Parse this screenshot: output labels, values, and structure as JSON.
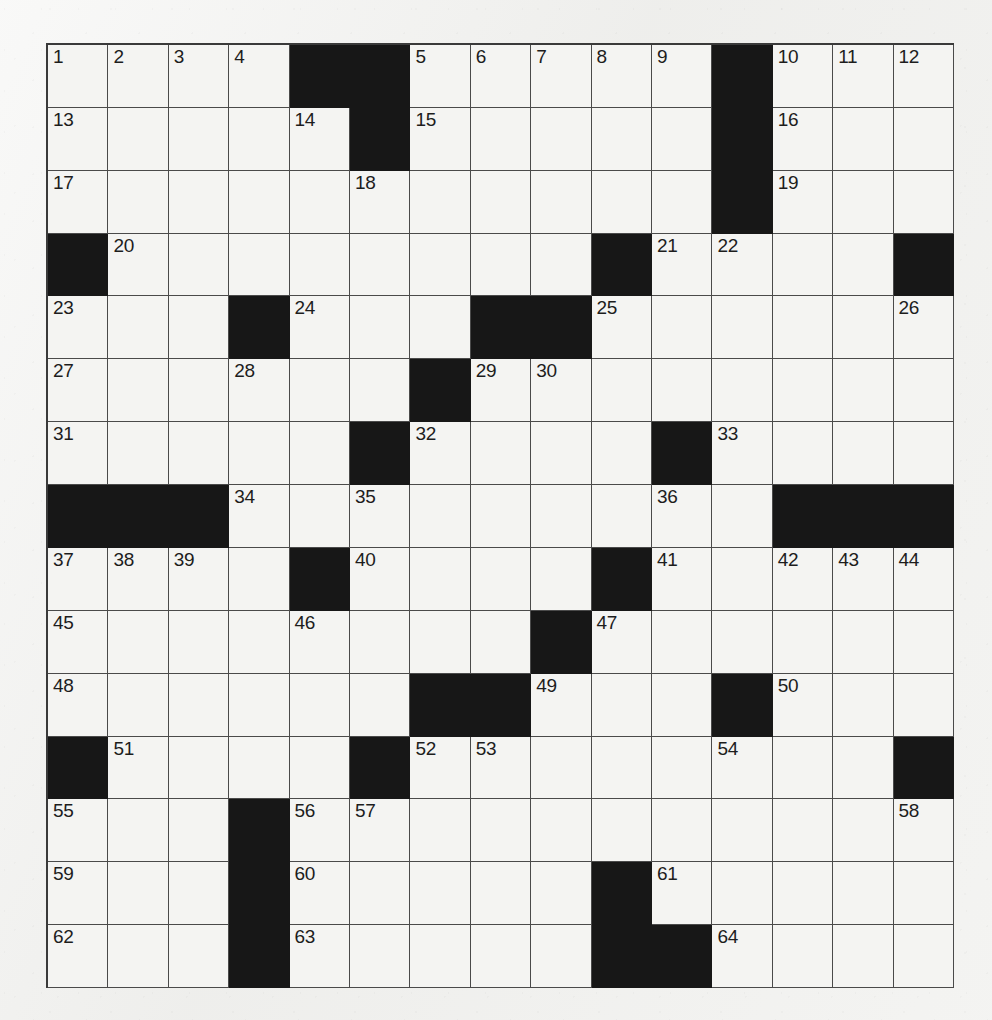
{
  "puzzle": {
    "type": "crossword-grid",
    "rows": 15,
    "columns": 15,
    "cell_size_px": 60.5,
    "colors": {
      "paper": "#f1f1ef",
      "cell_fill": "#f4f4f2",
      "block_fill": "#171717",
      "grid_line": "#4a4a4a",
      "number_text": "#1d1d1d"
    },
    "highest_clue_number": 64,
    "legend": {
      "open_cell": "white/blank fillable square",
      "block_cell": "solid black square"
    },
    "grid": [
      [
        {
          "block": false,
          "number": "1"
        },
        {
          "block": false,
          "number": "2"
        },
        {
          "block": false,
          "number": "3"
        },
        {
          "block": false,
          "number": "4"
        },
        {
          "block": true,
          "number": ""
        },
        {
          "block": true,
          "number": ""
        },
        {
          "block": false,
          "number": "5"
        },
        {
          "block": false,
          "number": "6"
        },
        {
          "block": false,
          "number": "7"
        },
        {
          "block": false,
          "number": "8"
        },
        {
          "block": false,
          "number": "9"
        },
        {
          "block": true,
          "number": ""
        },
        {
          "block": false,
          "number": "10"
        },
        {
          "block": false,
          "number": "11"
        },
        {
          "block": false,
          "number": "12"
        }
      ],
      [
        {
          "block": false,
          "number": "13"
        },
        {
          "block": false,
          "number": ""
        },
        {
          "block": false,
          "number": ""
        },
        {
          "block": false,
          "number": ""
        },
        {
          "block": false,
          "number": "14"
        },
        {
          "block": true,
          "number": ""
        },
        {
          "block": false,
          "number": "15"
        },
        {
          "block": false,
          "number": ""
        },
        {
          "block": false,
          "number": ""
        },
        {
          "block": false,
          "number": ""
        },
        {
          "block": false,
          "number": ""
        },
        {
          "block": true,
          "number": ""
        },
        {
          "block": false,
          "number": "16"
        },
        {
          "block": false,
          "number": ""
        },
        {
          "block": false,
          "number": ""
        }
      ],
      [
        {
          "block": false,
          "number": "17"
        },
        {
          "block": false,
          "number": ""
        },
        {
          "block": false,
          "number": ""
        },
        {
          "block": false,
          "number": ""
        },
        {
          "block": false,
          "number": ""
        },
        {
          "block": false,
          "number": "18"
        },
        {
          "block": false,
          "number": ""
        },
        {
          "block": false,
          "number": ""
        },
        {
          "block": false,
          "number": ""
        },
        {
          "block": false,
          "number": ""
        },
        {
          "block": false,
          "number": ""
        },
        {
          "block": true,
          "number": ""
        },
        {
          "block": false,
          "number": "19"
        },
        {
          "block": false,
          "number": ""
        },
        {
          "block": false,
          "number": ""
        }
      ],
      [
        {
          "block": true,
          "number": ""
        },
        {
          "block": false,
          "number": "20"
        },
        {
          "block": false,
          "number": ""
        },
        {
          "block": false,
          "number": ""
        },
        {
          "block": false,
          "number": ""
        },
        {
          "block": false,
          "number": ""
        },
        {
          "block": false,
          "number": ""
        },
        {
          "block": false,
          "number": ""
        },
        {
          "block": false,
          "number": ""
        },
        {
          "block": true,
          "number": ""
        },
        {
          "block": false,
          "number": "21"
        },
        {
          "block": false,
          "number": "22"
        },
        {
          "block": false,
          "number": ""
        },
        {
          "block": false,
          "number": ""
        },
        {
          "block": true,
          "number": ""
        }
      ],
      [
        {
          "block": false,
          "number": "23"
        },
        {
          "block": false,
          "number": ""
        },
        {
          "block": false,
          "number": ""
        },
        {
          "block": true,
          "number": ""
        },
        {
          "block": false,
          "number": "24"
        },
        {
          "block": false,
          "number": ""
        },
        {
          "block": false,
          "number": ""
        },
        {
          "block": true,
          "number": ""
        },
        {
          "block": true,
          "number": ""
        },
        {
          "block": false,
          "number": "25"
        },
        {
          "block": false,
          "number": ""
        },
        {
          "block": false,
          "number": ""
        },
        {
          "block": false,
          "number": ""
        },
        {
          "block": false,
          "number": ""
        },
        {
          "block": false,
          "number": "26"
        }
      ],
      [
        {
          "block": false,
          "number": "27"
        },
        {
          "block": false,
          "number": ""
        },
        {
          "block": false,
          "number": ""
        },
        {
          "block": false,
          "number": "28"
        },
        {
          "block": false,
          "number": ""
        },
        {
          "block": false,
          "number": ""
        },
        {
          "block": true,
          "number": ""
        },
        {
          "block": false,
          "number": "29"
        },
        {
          "block": false,
          "number": "30"
        },
        {
          "block": false,
          "number": ""
        },
        {
          "block": false,
          "number": ""
        },
        {
          "block": false,
          "number": ""
        },
        {
          "block": false,
          "number": ""
        },
        {
          "block": false,
          "number": ""
        },
        {
          "block": false,
          "number": ""
        }
      ],
      [
        {
          "block": false,
          "number": "31"
        },
        {
          "block": false,
          "number": ""
        },
        {
          "block": false,
          "number": ""
        },
        {
          "block": false,
          "number": ""
        },
        {
          "block": false,
          "number": ""
        },
        {
          "block": true,
          "number": ""
        },
        {
          "block": false,
          "number": "32"
        },
        {
          "block": false,
          "number": ""
        },
        {
          "block": false,
          "number": ""
        },
        {
          "block": false,
          "number": ""
        },
        {
          "block": true,
          "number": ""
        },
        {
          "block": false,
          "number": "33"
        },
        {
          "block": false,
          "number": ""
        },
        {
          "block": false,
          "number": ""
        },
        {
          "block": false,
          "number": ""
        }
      ],
      [
        {
          "block": true,
          "number": ""
        },
        {
          "block": true,
          "number": ""
        },
        {
          "block": true,
          "number": ""
        },
        {
          "block": false,
          "number": "34"
        },
        {
          "block": false,
          "number": ""
        },
        {
          "block": false,
          "number": "35"
        },
        {
          "block": false,
          "number": ""
        },
        {
          "block": false,
          "number": ""
        },
        {
          "block": false,
          "number": ""
        },
        {
          "block": false,
          "number": ""
        },
        {
          "block": false,
          "number": "36"
        },
        {
          "block": false,
          "number": ""
        },
        {
          "block": true,
          "number": ""
        },
        {
          "block": true,
          "number": ""
        },
        {
          "block": true,
          "number": ""
        }
      ],
      [
        {
          "block": false,
          "number": "37"
        },
        {
          "block": false,
          "number": "38"
        },
        {
          "block": false,
          "number": "39"
        },
        {
          "block": false,
          "number": ""
        },
        {
          "block": true,
          "number": ""
        },
        {
          "block": false,
          "number": "40"
        },
        {
          "block": false,
          "number": ""
        },
        {
          "block": false,
          "number": ""
        },
        {
          "block": false,
          "number": ""
        },
        {
          "block": true,
          "number": ""
        },
        {
          "block": false,
          "number": "41"
        },
        {
          "block": false,
          "number": ""
        },
        {
          "block": false,
          "number": "42"
        },
        {
          "block": false,
          "number": "43"
        },
        {
          "block": false,
          "number": "44"
        }
      ],
      [
        {
          "block": false,
          "number": "45"
        },
        {
          "block": false,
          "number": ""
        },
        {
          "block": false,
          "number": ""
        },
        {
          "block": false,
          "number": ""
        },
        {
          "block": false,
          "number": "46"
        },
        {
          "block": false,
          "number": ""
        },
        {
          "block": false,
          "number": ""
        },
        {
          "block": false,
          "number": ""
        },
        {
          "block": true,
          "number": ""
        },
        {
          "block": false,
          "number": "47"
        },
        {
          "block": false,
          "number": ""
        },
        {
          "block": false,
          "number": ""
        },
        {
          "block": false,
          "number": ""
        },
        {
          "block": false,
          "number": ""
        },
        {
          "block": false,
          "number": ""
        }
      ],
      [
        {
          "block": false,
          "number": "48"
        },
        {
          "block": false,
          "number": ""
        },
        {
          "block": false,
          "number": ""
        },
        {
          "block": false,
          "number": ""
        },
        {
          "block": false,
          "number": ""
        },
        {
          "block": false,
          "number": ""
        },
        {
          "block": true,
          "number": ""
        },
        {
          "block": true,
          "number": ""
        },
        {
          "block": false,
          "number": "49"
        },
        {
          "block": false,
          "number": ""
        },
        {
          "block": false,
          "number": ""
        },
        {
          "block": true,
          "number": ""
        },
        {
          "block": false,
          "number": "50"
        },
        {
          "block": false,
          "number": ""
        },
        {
          "block": false,
          "number": ""
        }
      ],
      [
        {
          "block": true,
          "number": ""
        },
        {
          "block": false,
          "number": "51"
        },
        {
          "block": false,
          "number": ""
        },
        {
          "block": false,
          "number": ""
        },
        {
          "block": false,
          "number": ""
        },
        {
          "block": true,
          "number": ""
        },
        {
          "block": false,
          "number": "52"
        },
        {
          "block": false,
          "number": "53"
        },
        {
          "block": false,
          "number": ""
        },
        {
          "block": false,
          "number": ""
        },
        {
          "block": false,
          "number": ""
        },
        {
          "block": false,
          "number": "54"
        },
        {
          "block": false,
          "number": ""
        },
        {
          "block": false,
          "number": ""
        },
        {
          "block": true,
          "number": ""
        }
      ],
      [
        {
          "block": false,
          "number": "55"
        },
        {
          "block": false,
          "number": ""
        },
        {
          "block": false,
          "number": ""
        },
        {
          "block": true,
          "number": ""
        },
        {
          "block": false,
          "number": "56"
        },
        {
          "block": false,
          "number": "57"
        },
        {
          "block": false,
          "number": ""
        },
        {
          "block": false,
          "number": ""
        },
        {
          "block": false,
          "number": ""
        },
        {
          "block": false,
          "number": ""
        },
        {
          "block": false,
          "number": ""
        },
        {
          "block": false,
          "number": ""
        },
        {
          "block": false,
          "number": ""
        },
        {
          "block": false,
          "number": ""
        },
        {
          "block": false,
          "number": "58"
        }
      ],
      [
        {
          "block": false,
          "number": "59"
        },
        {
          "block": false,
          "number": ""
        },
        {
          "block": false,
          "number": ""
        },
        {
          "block": true,
          "number": ""
        },
        {
          "block": false,
          "number": "60"
        },
        {
          "block": false,
          "number": ""
        },
        {
          "block": false,
          "number": ""
        },
        {
          "block": false,
          "number": ""
        },
        {
          "block": false,
          "number": ""
        },
        {
          "block": true,
          "number": ""
        },
        {
          "block": false,
          "number": "61"
        },
        {
          "block": false,
          "number": ""
        },
        {
          "block": false,
          "number": ""
        },
        {
          "block": false,
          "number": ""
        },
        {
          "block": false,
          "number": ""
        }
      ],
      [
        {
          "block": false,
          "number": "62"
        },
        {
          "block": false,
          "number": ""
        },
        {
          "block": false,
          "number": ""
        },
        {
          "block": true,
          "number": ""
        },
        {
          "block": false,
          "number": "63"
        },
        {
          "block": false,
          "number": ""
        },
        {
          "block": false,
          "number": ""
        },
        {
          "block": false,
          "number": ""
        },
        {
          "block": false,
          "number": ""
        },
        {
          "block": true,
          "number": ""
        },
        {
          "block": true,
          "number": ""
        },
        {
          "block": false,
          "number": "64"
        },
        {
          "block": false,
          "number": ""
        },
        {
          "block": false,
          "number": ""
        },
        {
          "block": false,
          "number": ""
        }
      ]
    ]
  }
}
